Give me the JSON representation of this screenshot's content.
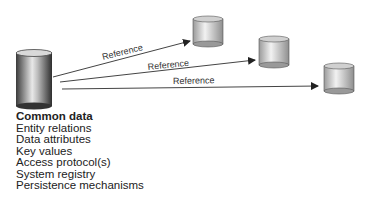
{
  "source": {
    "title": "Common data",
    "items": [
      "Entity relations",
      "Data attributes",
      "Key values",
      "Access protocol(s)",
      "System registry",
      "Persistence mechanisms"
    ]
  },
  "references": [
    {
      "label": "Reference",
      "target": "database-1"
    },
    {
      "label": "Reference",
      "target": "database-2"
    },
    {
      "label": "Reference",
      "target": "database-3"
    }
  ],
  "colors": {
    "line": "#444444",
    "text": "#222222"
  }
}
